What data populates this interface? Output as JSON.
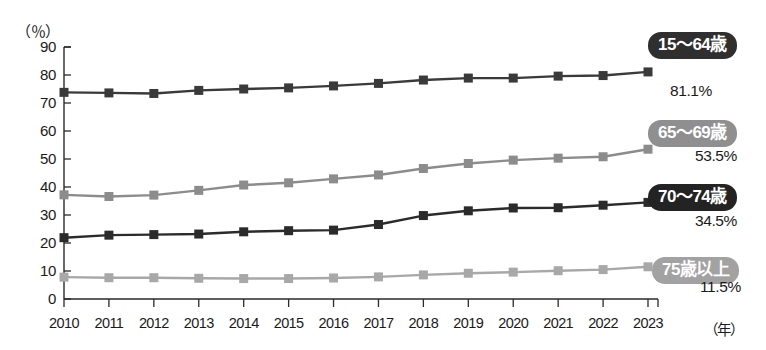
{
  "chart_data": {
    "type": "line",
    "title": "",
    "xlabel": "年",
    "ylabel": "（％）",
    "x": [
      2010,
      2011,
      2012,
      2013,
      2014,
      2015,
      2016,
      2017,
      2018,
      2019,
      2020,
      2021,
      2022,
      2023
    ],
    "categories": [
      "2010",
      "2011",
      "2012",
      "2013",
      "2014",
      "2015",
      "2016",
      "2017",
      "2018",
      "2019",
      "2020",
      "2021",
      "2022",
      "2023"
    ],
    "xlim": [
      2010,
      2023
    ],
    "ylim": [
      0,
      90
    ],
    "yticks": [
      0,
      10,
      20,
      30,
      40,
      50,
      60,
      70,
      80,
      90
    ],
    "ytick_labels": [
      "0",
      "10",
      "20",
      "30",
      "40",
      "50",
      "60",
      "70",
      "80",
      "90"
    ],
    "grid": false,
    "legend_position": "right-inline",
    "series": [
      {
        "name": "15〜64歳",
        "color": "#3a3a3a",
        "end_value_label": "81.1%",
        "values": [
          73.8,
          73.6,
          73.4,
          74.5,
          75.0,
          75.4,
          76.1,
          77.0,
          78.2,
          78.9,
          78.9,
          79.6,
          79.8,
          81.1
        ]
      },
      {
        "name": "65〜69歳",
        "color": "#8c8c8c",
        "end_value_label": "53.5%",
        "values": [
          37.2,
          36.6,
          37.1,
          38.8,
          40.7,
          41.5,
          42.9,
          44.3,
          46.6,
          48.4,
          49.6,
          50.3,
          50.8,
          53.5
        ]
      },
      {
        "name": "70〜74歳",
        "color": "#2b2b2b",
        "end_value_label": "34.5%",
        "values": [
          21.9,
          22.8,
          23.0,
          23.2,
          24.0,
          24.4,
          24.6,
          26.6,
          29.8,
          31.5,
          32.5,
          32.6,
          33.5,
          34.5
        ]
      },
      {
        "name": "75歳以上",
        "color": "#a8a8a8",
        "end_value_label": "11.5%",
        "values": [
          7.8,
          7.6,
          7.6,
          7.4,
          7.3,
          7.3,
          7.5,
          7.9,
          8.6,
          9.2,
          9.6,
          10.1,
          10.5,
          11.5
        ]
      }
    ]
  },
  "axis": {
    "y_unit": "（％）",
    "x_unit": "（年）",
    "yticks": [
      "90",
      "80",
      "70",
      "60",
      "50",
      "40",
      "30",
      "20",
      "10",
      "0"
    ],
    "xticks": [
      "2010",
      "2011",
      "2012",
      "2013",
      "2014",
      "2015",
      "2016",
      "2017",
      "2018",
      "2019",
      "2020",
      "2021",
      "2022",
      "2023"
    ]
  },
  "legend": [
    {
      "label": "15〜64歳",
      "value": "81.1%",
      "badge_color": "#2f2f2f",
      "text_color": "#ffffff"
    },
    {
      "label": "65〜69歳",
      "value": "53.5%",
      "badge_color": "#8f8f8f",
      "text_color": "#ffffff"
    },
    {
      "label": "70〜74歳",
      "value": "34.5%",
      "badge_color": "#232323",
      "text_color": "#ffffff"
    },
    {
      "label": "75歳以上",
      "value": "11.5%",
      "badge_color": "#a2a2a2",
      "text_color": "#ffffff"
    }
  ]
}
